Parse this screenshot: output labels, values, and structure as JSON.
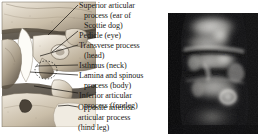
{
  "figure": {
    "panels": {
      "illustration_name": "lumbar-vertebra-oblique-drawing",
      "radiograph_name": "lumbar-spine-oblique-radiograph"
    }
  },
  "labels": [
    {
      "text": "Superior articular",
      "indent": false
    },
    {
      "text": "process (ear of",
      "indent": true
    },
    {
      "text": "Scottie dog)",
      "indent": true
    },
    {
      "text": "Pedicle (eye)",
      "indent": false
    },
    {
      "text": "Transverse process",
      "indent": false
    },
    {
      "text": "(head)",
      "indent": true
    },
    {
      "text": "Isthmus (neck)",
      "indent": false
    },
    {
      "text": "Lamina and spinous",
      "indent": false
    },
    {
      "text": "process (body)",
      "indent": true
    },
    {
      "text": "Inferior articular",
      "indent": false
    },
    {
      "text": "process (foreleg)",
      "indent": true
    },
    {
      "text": "Opposite inferior",
      "indent": false
    },
    {
      "text": "articular process",
      "indent": false
    },
    {
      "text": "(hind leg)",
      "indent": false
    }
  ],
  "colors": {
    "text": "#1b1a18",
    "leader_line": "#15120f",
    "page_background": "#ffffff",
    "illustration_bone_light": "#e9e3d8",
    "illustration_bone_mid": "#b8ac98",
    "illustration_bone_dark": "#6e6454",
    "illustration_shadow": "#3a332a",
    "radiograph_dark": "#0d0d0d",
    "radiograph_mid": "#6a6a6a",
    "radiograph_bright": "#e8e8e6"
  }
}
